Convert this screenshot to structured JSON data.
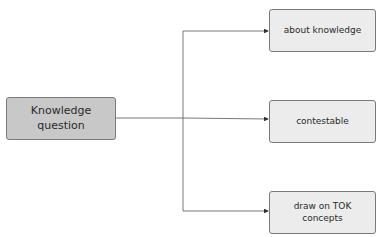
{
  "diagram": {
    "top_fragment": "· .",
    "source": {
      "label": "Knowledge question",
      "line1": "Knowledge",
      "line2": "question",
      "fill": "#c8c8c8"
    },
    "targets": [
      {
        "label": "about knowledge",
        "line1": "about knowledge",
        "line2": "",
        "fill": "#ececec"
      },
      {
        "label": "contestable",
        "line1": "contestable",
        "line2": "",
        "fill": "#ececec"
      },
      {
        "label": "draw on TOK concepts",
        "line1": "draw on TOK",
        "line2": "concepts",
        "fill": "#ececec"
      }
    ],
    "edges": [
      {
        "from": "Knowledge question",
        "to": "about knowledge"
      },
      {
        "from": "Knowledge question",
        "to": "contestable"
      },
      {
        "from": "Knowledge question",
        "to": "draw on TOK concepts"
      }
    ],
    "line_color": "#555555"
  }
}
